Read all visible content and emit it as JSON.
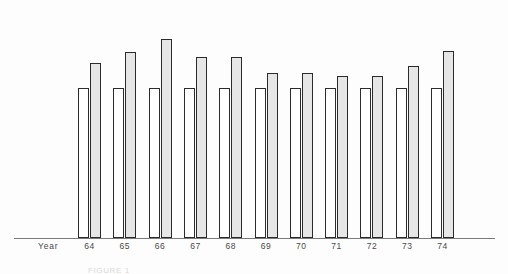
{
  "figure": {
    "axis_label": "Year",
    "caption": "FIGURE 1",
    "axis_color": "#7a7a7a",
    "bar_outline_color": "#2b2b2b",
    "reference_bar_color": "#ffffff",
    "value_bar_color": "#e6e6e6",
    "background_color": "#fdfdfd"
  },
  "chart_data": {
    "type": "bar",
    "title": "",
    "subtitle": "",
    "xlabel": "Year",
    "ylabel": "",
    "grid": false,
    "legend": null,
    "categories": [
      "64",
      "65",
      "66",
      "67",
      "68",
      "69",
      "70",
      "71",
      "72",
      "73",
      "74"
    ],
    "ylim": [
      0,
      135
    ],
    "series": [
      {
        "name": "Reference",
        "fill": "white",
        "values": [
          100,
          100,
          100,
          100,
          100,
          100,
          100,
          100,
          100,
          100,
          100
        ]
      },
      {
        "name": "Value",
        "fill": "stippled-gray",
        "values": [
          117,
          124,
          133,
          121,
          121,
          110,
          110,
          108,
          108,
          115,
          125
        ]
      }
    ],
    "annotations": []
  }
}
